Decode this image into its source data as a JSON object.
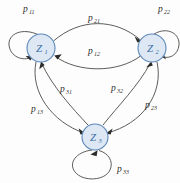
{
  "diagram": {
    "type": "state-transition-graph",
    "title": "",
    "background_color": "#fdfdfd",
    "node_fill": "#dde8f4",
    "node_stroke": "#5b87b8",
    "edge_color": "#4a4a46",
    "label_color": "#2f2f2c",
    "nodes": [
      {
        "id": "z1",
        "base": "Z",
        "sub": "1",
        "cx": 41,
        "cy": 48,
        "r": 14
      },
      {
        "id": "z2",
        "base": "Z",
        "sub": "2",
        "cx": 152,
        "cy": 48,
        "r": 14
      },
      {
        "id": "z3",
        "base": "Z",
        "sub": "3",
        "cx": 95,
        "cy": 137,
        "r": 13
      }
    ],
    "edges": [
      {
        "id": "e11",
        "base": "p",
        "sub": "11",
        "from": "z1",
        "to": "z1",
        "kind": "self-loop",
        "lx": 23,
        "ly": 9
      },
      {
        "id": "e22",
        "base": "p",
        "sub": "22",
        "from": "z2",
        "to": "z2",
        "kind": "self-loop",
        "lx": 158,
        "ly": 9
      },
      {
        "id": "e33",
        "base": "p",
        "sub": "33",
        "from": "z3",
        "to": "z3",
        "kind": "self-loop",
        "lx": 117,
        "ly": 169
      },
      {
        "id": "e21",
        "base": "p",
        "sub": "21",
        "from": "z1",
        "to": "z2",
        "kind": "curve",
        "lx": 91,
        "ly": 18
      },
      {
        "id": "e12",
        "base": "p",
        "sub": "12",
        "from": "z2",
        "to": "z1",
        "kind": "curve",
        "lx": 91,
        "ly": 51
      },
      {
        "id": "e31",
        "base": "p",
        "sub": "31",
        "from": "z3",
        "to": "z1",
        "kind": "curve",
        "lx": 63,
        "ly": 89
      },
      {
        "id": "e13",
        "base": "p",
        "sub": "13",
        "from": "z1",
        "to": "z3",
        "kind": "curve",
        "lx": 34,
        "ly": 109
      },
      {
        "id": "e32",
        "base": "p",
        "sub": "32",
        "from": "z3",
        "to": "z2",
        "kind": "curve",
        "lx": 114,
        "ly": 88
      },
      {
        "id": "e23",
        "base": "p",
        "sub": "23",
        "from": "z2",
        "to": "z3",
        "kind": "curve",
        "lx": 148,
        "ly": 105
      }
    ]
  }
}
